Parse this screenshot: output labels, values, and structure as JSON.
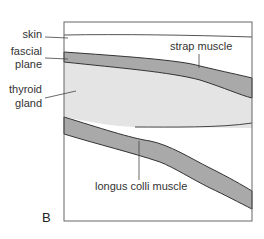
{
  "figure": {
    "panel_letter": "B",
    "labels": {
      "skin": "skin",
      "fascial_plane_line1": "fascial",
      "fascial_plane_line2": "plane",
      "thyroid_line1": "thyroid",
      "thyroid_line2": "gland",
      "strap_muscle": "strap muscle",
      "longus_colli": "longus colli muscle"
    },
    "colors": {
      "muscle_fill": "#a9a9a9",
      "thyroid_fill": "#e4e4e4",
      "outline": "#444444",
      "frame": "#666666",
      "background": "#ffffff"
    }
  }
}
